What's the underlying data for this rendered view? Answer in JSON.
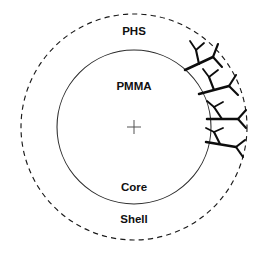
{
  "figure": {
    "kind": "core-shell-particle-schematic",
    "background_color": "#ffffff",
    "width": 263,
    "height": 258
  },
  "geometry": {
    "center_x": 134,
    "center_y": 127,
    "inner_radius": 77,
    "outer_radius": 113,
    "center_marker_arm": 7
  },
  "colors": {
    "outer_circle_stroke": "#1b1b1b",
    "inner_circle_stroke": "#2a2a2a",
    "branch_stroke": "#0d0d0d",
    "label_fill": "#101010",
    "center_mark_stroke": "#4a4a4a"
  },
  "labels": {
    "shell_polymer": "PHS",
    "core_polymer": "PMMA",
    "core_region": "Core",
    "shell_region": "Shell"
  },
  "label_positions": {
    "shell_polymer": {
      "x": 134,
      "y": 32
    },
    "core_polymer": {
      "x": 134,
      "y": 87
    },
    "core_region": {
      "x": 134,
      "y": 188
    },
    "shell_region": {
      "x": 134,
      "y": 220
    }
  },
  "boundaries": [
    {
      "name": "outer-shell-boundary",
      "style": "dashed",
      "radius": 113,
      "dash": "5.2 4.1",
      "stroke_width": 1.15
    },
    {
      "name": "inner-core-boundary",
      "style": "solid",
      "radius": 77,
      "stroke_width": 1.05
    }
  ],
  "dendrons": [
    {
      "name": "dendron-1",
      "anchor_angle_deg": -48,
      "paths": [
        "M 185 70 L 213 57",
        "M 199 64 L 196 50",
        "M 213 57 L 222 67",
        "M 213 57 L 218 44",
        "M 196 50 L 190 41",
        "M 196 50 L 204 43"
      ]
    },
    {
      "name": "dendron-2",
      "anchor_angle_deg": -25,
      "paths": [
        "M 199 94 L 229 86",
        "M 214 90 L 209 77",
        "M 229 86 L 238 95",
        "M 229 86 L 236 75",
        "M 209 77 L 203 69",
        "M 209 77 L 218 70"
      ]
    },
    {
      "name": "dendron-3",
      "anchor_angle_deg": -4,
      "paths": [
        "M 207 119 L 238 119",
        "M 222 119 L 214 107",
        "M 238 119 L 246 128",
        "M 238 119 L 246 110",
        "M 214 107 L 207 101",
        "M 214 107 L 223 102"
      ]
    },
    {
      "name": "dendron-4",
      "anchor_angle_deg": 14,
      "paths": [
        "M 206 142 L 236 147",
        "M 220 144 L 214 132",
        "M 236 147 L 243 157",
        "M 236 147 L 245 140",
        "M 214 132 L 206 128",
        "M 214 132 L 223 128"
      ]
    }
  ],
  "notes": {
    "graft_side": "right",
    "graft_count": 4
  }
}
